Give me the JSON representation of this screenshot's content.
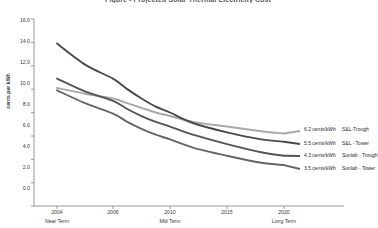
{
  "chart_data": {
    "type": "line",
    "title": "Figure - Projected Solar Thermal Electricity Cost",
    "xlabel": "",
    "ylabel": "cents per kWh",
    "ylim": [
      0.0,
      16.0
    ],
    "ytick_step": 2.0,
    "ytick_labels": [
      "0.0",
      "2.0",
      "4.0",
      "6.0",
      "8.0",
      "10.0",
      "12.0",
      "14.0",
      "16.0"
    ],
    "ytick_values": [
      0.0,
      2.0,
      4.0,
      6.0,
      8.0,
      10.0,
      12.0,
      14.0,
      16.0
    ],
    "xtick_labels": [
      "2004",
      "2006",
      "2010",
      "2015",
      "2020"
    ],
    "xtick_values": [
      2004,
      2006,
      2010,
      2015,
      2020
    ],
    "x_phase_labels": [
      {
        "label": "Near Term",
        "at": 2004
      },
      {
        "label": "Mid Term",
        "at": 2010
      },
      {
        "label": "Long Term",
        "at": 2020
      }
    ],
    "grid": false,
    "legend_position": "right-inline",
    "series": [
      {
        "name": "S&L-Trough",
        "end_value_label": "6.2 cents/kWh",
        "color": "#a8a8a8",
        "x": [
          2004,
          2005,
          2006,
          2007,
          2008,
          2009,
          2010,
          2012,
          2015,
          2018,
          2020
        ],
        "values": [
          10.1,
          9.6,
          9.2,
          8.8,
          8.4,
          8.0,
          7.7,
          7.2,
          6.8,
          6.4,
          6.2
        ]
      },
      {
        "name": "S&L - Tower",
        "end_value_label": "5.5 cents/kWh",
        "color": "#4a4a4a",
        "x": [
          2004,
          2005,
          2006,
          2007,
          2008,
          2009,
          2010,
          2012,
          2015,
          2018,
          2020
        ],
        "values": [
          13.9,
          12.1,
          10.9,
          10.0,
          9.2,
          8.5,
          8.0,
          7.1,
          6.3,
          5.7,
          5.5
        ]
      },
      {
        "name": "Sunlab - Trough",
        "end_value_label": "4.3 cents/kWh",
        "color": "#555555",
        "x": [
          2004,
          2005,
          2006,
          2007,
          2008,
          2009,
          2010,
          2012,
          2015,
          2018,
          2020
        ],
        "values": [
          10.9,
          9.8,
          9.0,
          8.3,
          7.7,
          7.2,
          6.8,
          6.1,
          5.3,
          4.6,
          4.3
        ]
      },
      {
        "name": "Sunlab - Tower",
        "end_value_label": "3.5 cents/kWh",
        "color": "#656565",
        "x": [
          2004,
          2005,
          2006,
          2007,
          2008,
          2009,
          2010,
          2012,
          2015,
          2018,
          2020
        ],
        "values": [
          9.9,
          8.8,
          7.9,
          7.2,
          6.6,
          6.1,
          5.7,
          5.0,
          4.3,
          3.7,
          3.5
        ]
      }
    ]
  },
  "axis": {
    "axis_color": "#808080"
  }
}
